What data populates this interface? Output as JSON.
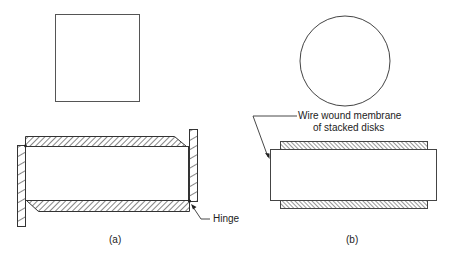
{
  "figure": {
    "panel_a": {
      "caption": "(a)",
      "hinge_label": "Hinge",
      "top_view_shape": "square",
      "side_view": "hinged plate module"
    },
    "panel_b": {
      "caption": "(b)",
      "callout_line1": "Wire wound membrane",
      "callout_line2": "of stacked disks",
      "top_view_shape": "circle",
      "side_view": "stacked disk module"
    },
    "colors": {
      "stroke": "#333333",
      "hatch": "#444444",
      "background": "#ffffff"
    }
  }
}
